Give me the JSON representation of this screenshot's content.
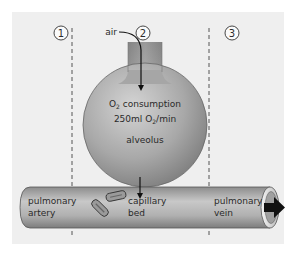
{
  "zones": [
    {
      "number": "1"
    },
    {
      "number": "2"
    },
    {
      "number": "3"
    }
  ],
  "labels": {
    "air": "air",
    "o2_consumption_prefix": "O",
    "o2_consumption_sub": "2",
    "o2_consumption_suffix": " consumption",
    "rate_prefix": "250ml O",
    "rate_sub": "2",
    "rate_suffix": "/min",
    "alveolus": "alveolus",
    "artery_line1": "pulmonary",
    "artery_line2": "artery",
    "capillary_line1": "capillary",
    "capillary_line2": "bed",
    "vein_line1": "pulmonary",
    "vein_line2": "vein"
  },
  "colors": {
    "panel_background": "#efefef",
    "structure_gray": "#9a9a9a",
    "outline": "#555555",
    "text": "#2a2a2a",
    "arrow": "#111111"
  }
}
